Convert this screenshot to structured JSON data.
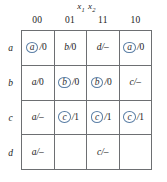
{
  "figure": {
    "name": "flow-table",
    "input_header": {
      "variable_1": "x",
      "subscript_1": "1",
      "variable_2": "x",
      "subscript_2": "2"
    },
    "column_headers": [
      "00",
      "01",
      "11",
      "10"
    ],
    "row_labels": [
      "a",
      "b",
      "c",
      "d"
    ],
    "colors": {
      "grid_line": "#6d6f72",
      "circle_accent": "#5b7fa6",
      "text": "#1a1a1a",
      "background": "#ffffff"
    }
  },
  "chart_data": {
    "type": "table",
    "title": "",
    "xlabel": "x1 x2",
    "ylabel": "",
    "categories": [
      "00",
      "01",
      "11",
      "10"
    ],
    "rows": [
      "a",
      "b",
      "c",
      "d"
    ],
    "cells": [
      [
        {
          "state": "a",
          "stable": true,
          "slash": "/",
          "output": "0",
          "text": "a/0"
        },
        {
          "state": "b",
          "stable": false,
          "slash": "/",
          "output": "0",
          "text": "b/0"
        },
        {
          "state": "d",
          "stable": false,
          "slash": "/",
          "output": "–",
          "text": "d/–"
        },
        {
          "state": "a",
          "stable": true,
          "slash": "/",
          "output": "0",
          "text": "a/0"
        }
      ],
      [
        {
          "state": "a",
          "stable": false,
          "slash": "/",
          "output": "0",
          "text": "a/0"
        },
        {
          "state": "b",
          "stable": true,
          "slash": "/",
          "output": "0",
          "text": "b/0"
        },
        {
          "state": "b",
          "stable": true,
          "slash": "/",
          "output": "0",
          "text": "b/0"
        },
        {
          "state": "c",
          "stable": false,
          "slash": "/",
          "output": "–",
          "text": "c/–"
        }
      ],
      [
        {
          "state": "a",
          "stable": false,
          "slash": "/",
          "output": "–",
          "text": "a/–"
        },
        {
          "state": "c",
          "stable": true,
          "slash": "/",
          "output": "1",
          "text": "c/1"
        },
        {
          "state": "c",
          "stable": true,
          "slash": "/",
          "output": "1",
          "text": "c/1"
        },
        {
          "state": "c",
          "stable": true,
          "slash": "/",
          "output": "1",
          "text": "c/1"
        }
      ],
      [
        {
          "state": "a",
          "stable": false,
          "slash": "/",
          "output": "–",
          "text": "a/–"
        },
        {
          "state": "",
          "stable": false,
          "slash": "",
          "output": "",
          "text": ""
        },
        {
          "state": "c",
          "stable": false,
          "slash": "/",
          "output": "–",
          "text": "c/–"
        },
        {
          "state": "",
          "stable": false,
          "slash": "",
          "output": "",
          "text": ""
        }
      ]
    ]
  }
}
